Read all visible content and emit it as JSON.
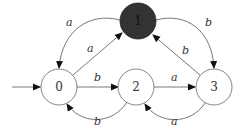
{
  "diagram": {
    "type": "finite-automaton",
    "start_state": "0",
    "nodes": [
      {
        "id": "0",
        "label": "0",
        "x": 59,
        "y": 87,
        "filled": false
      },
      {
        "id": "1",
        "label": "1",
        "x": 138,
        "y": 22,
        "filled": true,
        "fill_color": "#333333"
      },
      {
        "id": "2",
        "label": "2",
        "x": 136,
        "y": 87,
        "filled": false
      },
      {
        "id": "3",
        "label": "3",
        "x": 214,
        "y": 87,
        "filled": false
      }
    ],
    "edges": [
      {
        "from": "1",
        "to": "0",
        "label": "a",
        "curved": true
      },
      {
        "from": "0",
        "to": "1",
        "label": "a",
        "curved": false
      },
      {
        "from": "1",
        "to": "3",
        "label": "b",
        "curved": true
      },
      {
        "from": "3",
        "to": "1",
        "label": "b",
        "curved": false
      },
      {
        "from": "0",
        "to": "2",
        "label": "b",
        "curved": false
      },
      {
        "from": "2",
        "to": "0",
        "label": "b",
        "curved": true
      },
      {
        "from": "2",
        "to": "3",
        "label": "a",
        "curved": false
      },
      {
        "from": "3",
        "to": "2",
        "label": "a",
        "curved": true
      }
    ],
    "labels": {
      "e10": "a",
      "e01": "a",
      "e13": "b",
      "e31": "b",
      "e02": "b",
      "e20": "b",
      "e23": "a",
      "e32": "a",
      "n0": "0",
      "n1": "1",
      "n2": "2",
      "n3": "3"
    },
    "colors": {
      "stroke": "#555555",
      "node_fill": "#ffffff",
      "accepting_fill": "#333333"
    }
  }
}
